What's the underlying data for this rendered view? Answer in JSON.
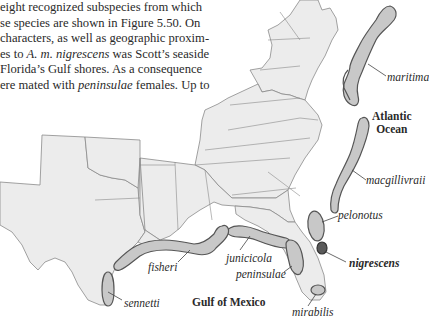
{
  "paragraph": {
    "lines": [
      {
        "pre": "eight recognized subspecies from which",
        "it": "",
        "post": ""
      },
      {
        "pre": "se species are shown in Figure 5.50. On",
        "it": "",
        "post": ""
      },
      {
        "pre": "characters, as well as geographic proxim-",
        "it": "",
        "post": ""
      },
      {
        "pre": "es to ",
        "it": "A. m. nigrescens",
        "post": " was Scott’s seaside"
      },
      {
        "pre": "Florida’s Gulf shores. As a consequence",
        "it": "",
        "post": ""
      },
      {
        "pre": "ere mated with ",
        "it": "peninsulae",
        "post": " females. Up to"
      }
    ]
  },
  "map": {
    "land_color": "#ececec",
    "border_color": "#8a8a8a",
    "range_fill": "#c8c8c8",
    "range_stroke": "#555555",
    "highlight_fill": "#5a5a5a",
    "water_labels": {
      "atlantic": [
        "Atlantic",
        "Ocean"
      ],
      "gulf": "Gulf of Mexico"
    },
    "subspecies": [
      {
        "name": "maritima",
        "style": "italic"
      },
      {
        "name": "macgillivraii",
        "style": "italic"
      },
      {
        "name": "pelonotus",
        "style": "italic"
      },
      {
        "name": "nigrescens",
        "style": "bold-italic"
      },
      {
        "name": "junicicola",
        "style": "italic"
      },
      {
        "name": "peninsulae",
        "style": "italic"
      },
      {
        "name": "fisheri",
        "style": "italic"
      },
      {
        "name": "sennetti",
        "style": "italic"
      },
      {
        "name": "mirabilis",
        "style": "italic"
      }
    ]
  }
}
